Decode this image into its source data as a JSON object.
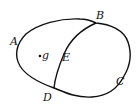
{
  "diagram": {
    "title": "",
    "labels": {
      "A": "A",
      "B": "B",
      "C": "C",
      "D": "D",
      "E": "E",
      "point": "g"
    },
    "colors": {
      "stroke": "#111111",
      "background": "#ffffff"
    }
  }
}
